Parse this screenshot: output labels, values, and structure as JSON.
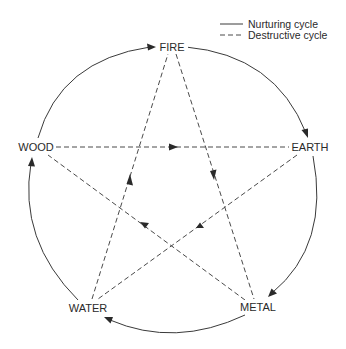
{
  "legend": {
    "nurturing_label": "Nurturing cycle",
    "destructive_label": "Destructive cycle"
  },
  "nodes": {
    "fire": "FIRE",
    "earth": "EARTH",
    "metal": "METAL",
    "water": "WATER",
    "wood": "WOOD"
  },
  "cycles": {
    "nurturing": [
      "WOOD",
      "FIRE",
      "EARTH",
      "METAL",
      "WATER",
      "WOOD"
    ],
    "destructive": [
      {
        "from": "FIRE",
        "to": "METAL"
      },
      {
        "from": "METAL",
        "to": "WOOD"
      },
      {
        "from": "WOOD",
        "to": "EARTH"
      },
      {
        "from": "EARTH",
        "to": "WATER"
      },
      {
        "from": "WATER",
        "to": "FIRE"
      }
    ]
  },
  "colors": {
    "line": "#3a3a3a",
    "text": "#2a2a2a",
    "background": "#ffffff"
  }
}
